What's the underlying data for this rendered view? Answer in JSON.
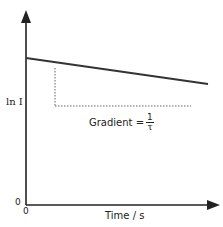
{
  "diagram": {
    "y_axis_label": "ln I",
    "x_axis_label": "Time / s",
    "origin_y_label": "0",
    "origin_x_label": "0",
    "gradient_text": "Gradient =",
    "gradient_numerator": "1",
    "gradient_denominator": "τ",
    "line_color": "#333333",
    "dotted_color": "#555555"
  }
}
